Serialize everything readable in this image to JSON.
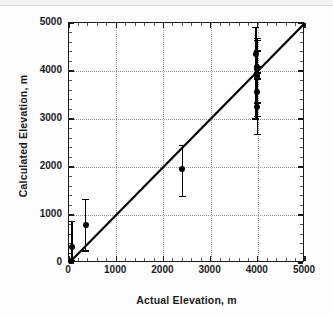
{
  "chart_data": {
    "type": "scatter",
    "title": "",
    "xlabel": "Actual Elevation, m",
    "ylabel": "Calculated Elevation, m",
    "xlim": [
      0,
      5000
    ],
    "ylim": [
      0,
      5000
    ],
    "xticks": [
      0,
      1000,
      2000,
      3000,
      4000,
      5000
    ],
    "yticks": [
      0,
      1000,
      2000,
      3000,
      4000,
      5000
    ],
    "xticklabels": [
      "0",
      "1000",
      "2000",
      "3000",
      "4000",
      "5000"
    ],
    "yticklabels": [
      "0",
      "1000",
      "2000",
      "3000",
      "4000",
      "5000"
    ],
    "grid": true,
    "grid_style": "dotted",
    "minor_ticks": true,
    "legend": null,
    "reference_line": {
      "name": "one-to-one-line",
      "type": "line",
      "x": [
        0,
        5000
      ],
      "y": [
        0,
        5000
      ],
      "style": "solid",
      "color": "#000000",
      "width": 2.2
    },
    "marker": {
      "shape": "circle",
      "color": "#000000",
      "size": 6
    },
    "errorbar": {
      "direction": "vertical",
      "color": "#000000",
      "capped": true
    },
    "points": [
      {
        "x": 40,
        "y": 50,
        "ylow": 50,
        "yhigh": 50
      },
      {
        "x": 60,
        "y": 330,
        "ylow": 55,
        "yhigh": 870
      },
      {
        "x": 350,
        "y": 800,
        "ylow": 250,
        "yhigh": 1320
      },
      {
        "x": 2400,
        "y": 1950,
        "ylow": 1390,
        "yhigh": 2450
      },
      {
        "x": 3960,
        "y": 4350,
        "ylow": 3000,
        "yhigh": 4900
      },
      {
        "x": 3985,
        "y": 4090,
        "ylow": 3960,
        "yhigh": 4680
      },
      {
        "x": 3985,
        "y": 4040,
        "ylow": 3960,
        "yhigh": 4640
      },
      {
        "x": 3985,
        "y": 3890,
        "ylow": 3350,
        "yhigh": 4420
      },
      {
        "x": 3985,
        "y": 3870,
        "ylow": 3330,
        "yhigh": 4400
      },
      {
        "x": 3990,
        "y": 3560,
        "ylow": 3050,
        "yhigh": 4080
      },
      {
        "x": 3990,
        "y": 3260,
        "ylow": 2680,
        "yhigh": 3830
      }
    ]
  }
}
